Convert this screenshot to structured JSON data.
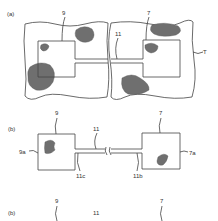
{
  "figure": {
    "panels": [
      {
        "id": "a",
        "label": "(a)",
        "refs": {
          "left_region": "9",
          "right_region": "7",
          "channel": "11",
          "substrate": "T"
        }
      },
      {
        "id": "b",
        "label": "(b)",
        "refs": {
          "left_region": "9",
          "right_region": "7",
          "channel": "11",
          "left_side": "9a",
          "right_side": "7a",
          "channel_left_end": "11c",
          "channel_right_end": "11b"
        }
      },
      {
        "id": "c",
        "label": "(b)",
        "refs": {
          "left_region": "9",
          "channel": "11",
          "right_region": "7"
        }
      }
    ]
  }
}
